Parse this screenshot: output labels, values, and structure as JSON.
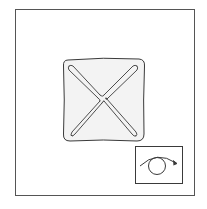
{
  "figure": {
    "colors": {
      "background": "#ffffff",
      "stroke": "#3a3a3a",
      "panel_fill": "#f3f3f3",
      "frame_stroke": "#555555"
    },
    "outer_frame": {
      "x": 15,
      "y": 9,
      "width": 179,
      "height": 186
    },
    "panel": {
      "x": 63,
      "y": 59,
      "width": 81,
      "height": 82
    },
    "inset": {
      "x": 135,
      "y": 146,
      "width": 47,
      "height": 37,
      "icon": "rotation-arrow-circle-icon"
    }
  }
}
